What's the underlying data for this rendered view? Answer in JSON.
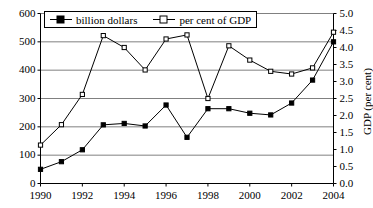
{
  "chart_data": {
    "type": "line",
    "title": "",
    "subtitle": "",
    "xlabel": "",
    "ylabel": "",
    "ylabel_right": "GDP (per cent)",
    "grid": true,
    "legend_position": "top-center",
    "x": [
      1990,
      1991,
      1992,
      1993,
      1994,
      1995,
      1996,
      1997,
      1998,
      1999,
      2000,
      2001,
      2002,
      2003,
      2004
    ],
    "xtick_labels": [
      "1990",
      "1992",
      "1994",
      "1996",
      "1998",
      "2000",
      "2002",
      "2004"
    ],
    "xticks": [
      1990,
      1992,
      1994,
      1996,
      1998,
      2000,
      2002,
      2004
    ],
    "xlim": [
      1990,
      2004
    ],
    "ylim": [
      0,
      600
    ],
    "ytick_labels": [
      "0",
      "100",
      "200",
      "300",
      "400",
      "500",
      "600"
    ],
    "yticks": [
      0,
      100,
      200,
      300,
      400,
      500,
      600
    ],
    "ylim_right": [
      0.0,
      5.0
    ],
    "ytick_labels_right": [
      "0.0",
      "0.5",
      "1.0",
      "1.5",
      "2.0",
      "2.5",
      "3.0",
      "3.5",
      "4.0",
      "4.5",
      "5.0"
    ],
    "yticks_right": [
      0.0,
      0.5,
      1.0,
      1.5,
      2.0,
      2.5,
      3.0,
      3.5,
      4.0,
      4.5,
      5.0
    ],
    "series": [
      {
        "name": "billion dollars",
        "axis": "left",
        "marker": "filled-square",
        "color": "#000000",
        "values": [
          50,
          77,
          119,
          207,
          212,
          203,
          277,
          163,
          264,
          264,
          248,
          242,
          284,
          365,
          500
        ]
      },
      {
        "name": "per cent of GDP",
        "axis": "right",
        "marker": "open-square",
        "color": "#000000",
        "values": [
          1.13,
          1.73,
          2.62,
          4.35,
          4.0,
          3.34,
          4.25,
          4.37,
          2.5,
          4.05,
          3.63,
          3.3,
          3.22,
          3.4,
          4.45
        ]
      }
    ]
  },
  "legend": {
    "entries": [
      {
        "label": "billion dollars",
        "marker": "filled-square"
      },
      {
        "label": "per cent of GDP",
        "marker": "open-square"
      }
    ]
  },
  "axes": {
    "right_title": "GDP (per cent)"
  }
}
